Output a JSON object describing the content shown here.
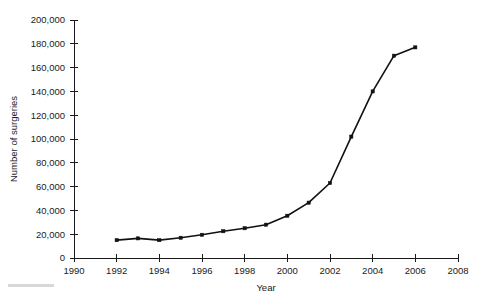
{
  "chart_data": {
    "type": "line",
    "title": "",
    "xlabel": "Year",
    "ylabel": "Number of surgeries",
    "x": [
      1992,
      1993,
      1994,
      1995,
      1996,
      1997,
      1998,
      1999,
      2000,
      2001,
      2002,
      2003,
      2004,
      2005,
      2006
    ],
    "values": [
      15000,
      16500,
      15000,
      17000,
      19500,
      22500,
      25000,
      28000,
      35500,
      46500,
      63000,
      102000,
      140000,
      170000,
      177000
    ],
    "series": [
      {
        "name": "Number of surgeries",
        "values": [
          15000,
          16500,
          15000,
          17000,
          19500,
          22500,
          25000,
          28000,
          35500,
          46500,
          63000,
          102000,
          140000,
          170000,
          177000
        ]
      }
    ],
    "xlim": [
      1990,
      2008
    ],
    "ylim": [
      0,
      200000
    ],
    "x_ticks": [
      1990,
      1992,
      1994,
      1996,
      1998,
      2000,
      2002,
      2004,
      2006,
      2008
    ],
    "x_tick_labels": [
      "1990",
      "1992",
      "1994",
      "1996",
      "1998",
      "2000",
      "2002",
      "2004",
      "2006",
      "2008"
    ],
    "y_ticks": [
      0,
      20000,
      40000,
      60000,
      80000,
      100000,
      120000,
      140000,
      160000,
      180000,
      200000
    ],
    "y_tick_labels": [
      "0",
      "20,000",
      "40,000",
      "60,000",
      "80,000",
      "100,000",
      "120,000",
      "140,000",
      "160,000",
      "180,000",
      "200,000"
    ],
    "grid": false,
    "legend": null,
    "legend_position": "none",
    "marker": "square",
    "line_color": "#111111",
    "marker_color": "#111111",
    "background_color": "#ffffff"
  }
}
